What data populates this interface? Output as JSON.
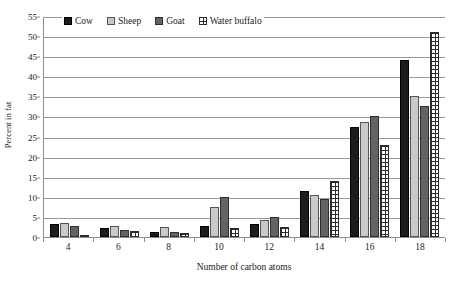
{
  "chart_data": {
    "type": "bar",
    "title": "",
    "xlabel": "Number of carbon atoms",
    "ylabel": "Percent in fat",
    "categories": [
      "4",
      "6",
      "8",
      "10",
      "12",
      "14",
      "16",
      "18"
    ],
    "ylim": [
      0,
      55
    ],
    "yticks": [
      0,
      5,
      10,
      15,
      20,
      25,
      30,
      35,
      40,
      45,
      50,
      55
    ],
    "grid": true,
    "legend_position": "top-left-inside",
    "series": [
      {
        "name": "Cow",
        "color": "#1c1c1c",
        "fill": "solid-black",
        "values": [
          3.2,
          2.2,
          1.2,
          2.8,
          3.2,
          11.5,
          27.5,
          44.0
        ]
      },
      {
        "name": "Sheep",
        "color": "#c9c9c9",
        "fill": "light-gray",
        "values": [
          3.5,
          2.8,
          2.6,
          7.5,
          4.3,
          10.5,
          28.5,
          35.0
        ]
      },
      {
        "name": "Goat",
        "color": "#636363",
        "fill": "dark-gray",
        "values": [
          2.8,
          1.8,
          1.2,
          10.0,
          5.0,
          9.5,
          30.0,
          32.5
        ]
      },
      {
        "name": "Water buffalo",
        "color": "#ffffff",
        "fill": "grid-hatch",
        "values": [
          0.5,
          1.5,
          1.0,
          2.2,
          2.5,
          14.0,
          23.0,
          51.0
        ]
      }
    ]
  },
  "axes": {
    "y_title": "Percent in fat",
    "x_title": "Number of carbon atoms"
  }
}
